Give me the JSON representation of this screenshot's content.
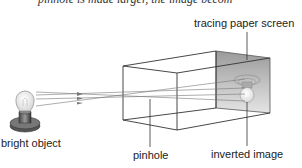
{
  "caption_fragment": "pinhole is made larger, the image becom",
  "labels": {
    "screen": "tracing paper screen",
    "object": "bright object",
    "pinhole": "pinhole",
    "image": "inverted image"
  }
}
